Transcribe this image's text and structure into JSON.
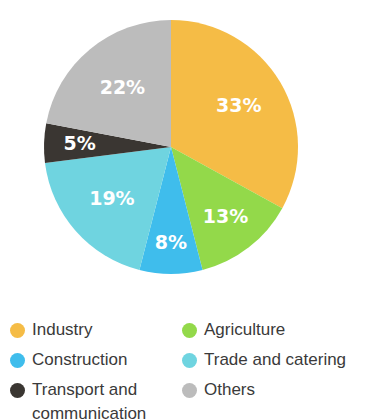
{
  "chart_data": {
    "type": "pie",
    "title": "",
    "legend_position": "bottom",
    "start_angle_deg": 0,
    "direction": "clockwise",
    "categories": [
      "Industry",
      "Agriculture",
      "Construction",
      "Trade and catering",
      "Transport and communication",
      "Others"
    ],
    "values": [
      33,
      13,
      8,
      19,
      5,
      22
    ],
    "value_labels": [
      "33%",
      "13%",
      "8%",
      "19%",
      "5%",
      "22%"
    ],
    "colors": [
      "#F5BC46",
      "#93D94A",
      "#3FBDEC",
      "#6FD4E0",
      "#3A3632",
      "#BCBCBC"
    ],
    "units": "percent",
    "total": 100
  },
  "pie": {
    "slices": [
      {
        "name": "Industry",
        "label": "33%",
        "value": 33,
        "color": "#F5BC46"
      },
      {
        "name": "Agriculture",
        "label": "13%",
        "value": 13,
        "color": "#93D94A"
      },
      {
        "name": "Construction",
        "label": "8%",
        "value": 8,
        "color": "#3FBDEC"
      },
      {
        "name": "Trade and catering",
        "label": "19%",
        "value": 19,
        "color": "#6FD4E0"
      },
      {
        "name": "Transport and communication",
        "label": "5%",
        "value": 5,
        "color": "#3A3632"
      },
      {
        "name": "Others",
        "label": "22%",
        "value": 22,
        "color": "#BCBCBC"
      }
    ]
  },
  "legend": {
    "left_column": [
      {
        "label": "Industry",
        "color": "#F5BC46",
        "second_line": ""
      },
      {
        "label": "Construction",
        "color": "#3FBDEC",
        "second_line": ""
      },
      {
        "label": "Transport and",
        "color": "#3A3632",
        "second_line": "communication"
      }
    ],
    "right_column": [
      {
        "label": "Agriculture",
        "color": "#93D94A",
        "second_line": ""
      },
      {
        "label": "Trade and catering",
        "color": "#6FD4E0",
        "second_line": ""
      },
      {
        "label": "Others",
        "color": "#BCBCBC",
        "second_line": ""
      }
    ]
  }
}
